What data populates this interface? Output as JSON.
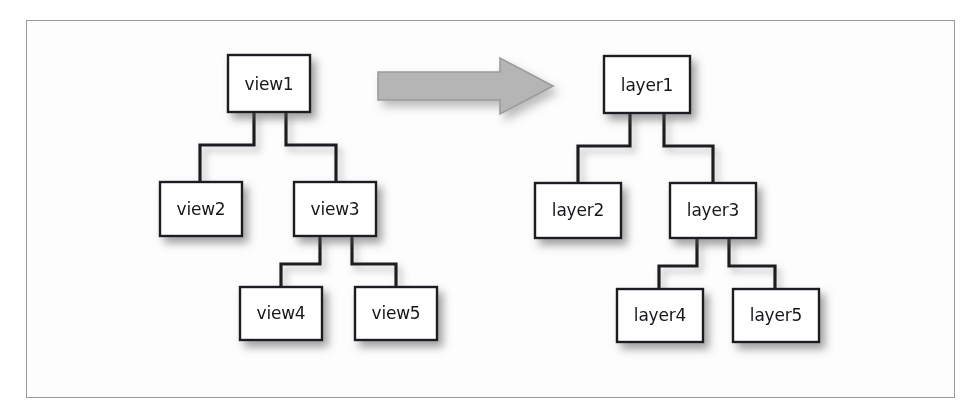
{
  "figure": {
    "caption": "",
    "background_color": "#fefefe",
    "frame_color": "#9a9a9e",
    "box_fill": "#ffffff",
    "box_border_color": "#1e1e20",
    "connector_color": "#1e1e20",
    "arrow_fill": "#b5b5b5",
    "arrow_stroke": "#9b9b9b",
    "text_color": "#17171a"
  },
  "left_tree": {
    "title": "view hierarchy",
    "root": "view1",
    "nodes": [
      {
        "id": "view1",
        "label": "view1",
        "x": 228,
        "y": 55,
        "w": 82,
        "h": 57
      },
      {
        "id": "view2",
        "label": "view2",
        "x": 160,
        "y": 182,
        "w": 82,
        "h": 54
      },
      {
        "id": "view3",
        "label": "view3",
        "x": 294,
        "y": 182,
        "w": 82,
        "h": 54
      },
      {
        "id": "view4",
        "label": "view4",
        "x": 240,
        "y": 287,
        "w": 82,
        "h": 53
      },
      {
        "id": "view5",
        "label": "view5",
        "x": 355,
        "y": 287,
        "w": 82,
        "h": 53
      }
    ],
    "edges": [
      {
        "from": "view1",
        "to": "view2"
      },
      {
        "from": "view1",
        "to": "view3"
      },
      {
        "from": "view3",
        "to": "view4"
      },
      {
        "from": "view3",
        "to": "view5"
      }
    ]
  },
  "right_tree": {
    "title": "layer hierarchy",
    "root": "layer1",
    "nodes": [
      {
        "id": "layer1",
        "label": "layer1",
        "x": 604,
        "y": 56,
        "w": 86,
        "h": 57
      },
      {
        "id": "layer2",
        "label": "layer2",
        "x": 535,
        "y": 183,
        "w": 86,
        "h": 55
      },
      {
        "id": "layer3",
        "label": "layer3",
        "x": 670,
        "y": 183,
        "w": 86,
        "h": 55
      },
      {
        "id": "layer4",
        "label": "layer4",
        "x": 617,
        "y": 289,
        "w": 86,
        "h": 53
      },
      {
        "id": "layer5",
        "label": "layer5",
        "x": 733,
        "y": 289,
        "w": 86,
        "h": 53
      }
    ],
    "edges": [
      {
        "from": "layer1",
        "to": "layer2"
      },
      {
        "from": "layer1",
        "to": "layer3"
      },
      {
        "from": "layer3",
        "to": "layer4"
      },
      {
        "from": "layer3",
        "to": "layer5"
      }
    ]
  },
  "transform_arrow": {
    "direction": "right",
    "icon": "block-arrow-right-icon",
    "x": 378,
    "y": 58,
    "width": 175,
    "height": 56
  }
}
